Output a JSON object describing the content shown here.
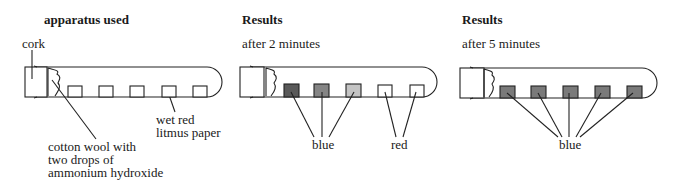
{
  "panels": [
    {
      "heading": "apparatus used",
      "subheading": "",
      "labels": {
        "cork": "cork",
        "litmus": "wet red\nlitmus paper",
        "cotton": "cotton wool with\ntwo drops of\nammonium hydroxide"
      },
      "paper_colors": [
        "#ffffff",
        "#ffffff",
        "#ffffff",
        "#ffffff",
        "#ffffff"
      ]
    },
    {
      "heading": "Results",
      "subheading": "after 2 minutes",
      "labels": {
        "blue": "blue",
        "red": "red"
      },
      "paper_colors": [
        "#5a5a5a",
        "#858585",
        "#c4c4c4",
        "#ffffff",
        "#ffffff"
      ]
    },
    {
      "heading": "Results",
      "subheading": "after 5 minutes",
      "labels": {
        "blue": "blue"
      },
      "paper_colors": [
        "#7a7a7a",
        "#7a7a7a",
        "#7a7a7a",
        "#7a7a7a",
        "#7a7a7a"
      ]
    }
  ],
  "colors": {
    "line": "#222222",
    "paper_wet_blue": "#7a7a7a"
  }
}
